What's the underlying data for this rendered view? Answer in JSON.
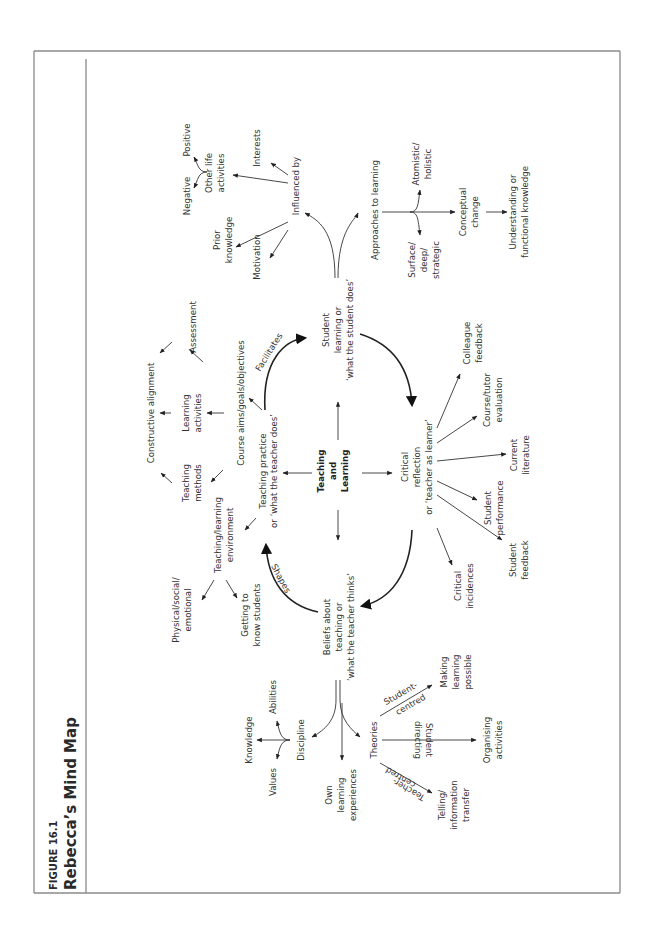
{
  "figure": {
    "number_label": "FIGURE 16.1",
    "title": "Rebecca’s Mind Map",
    "orientation": "rotated-90-ccw"
  },
  "center": {
    "line1": "Teaching",
    "line2": "and",
    "line3": "Learning"
  },
  "nodes": {
    "teaching_practice": [
      "Teaching practice",
      "or ‘what the teacher does’"
    ],
    "student_learning": [
      "Student",
      "learning or",
      "‘what the student does’"
    ],
    "critical_reflection": [
      "Critical",
      "reflection",
      "or ‘teacher as learner’"
    ],
    "beliefs": [
      "Beliefs about",
      "teaching or",
      "‘what the teacher thinks’"
    ],
    "course_aims": [
      "Course aims/goals/objectives"
    ],
    "teaching_methods": [
      "Teaching",
      "methods"
    ],
    "learning_activities": [
      "Learning",
      "activities"
    ],
    "assessment": [
      "Assessment"
    ],
    "constructive_alignment": [
      "Constructive alignment"
    ],
    "tl_environment": [
      "Teaching/learning",
      "environment"
    ],
    "physical_social": [
      "Physical/social/",
      "emotional"
    ],
    "getting_to_know": [
      "Getting to",
      "know students"
    ],
    "influenced_by": [
      "Influenced by"
    ],
    "prior_knowledge": [
      "Prior",
      "knowledge"
    ],
    "motivation": [
      "Motivation"
    ],
    "other_life": [
      "Other life",
      "activities"
    ],
    "interests": [
      "Interests"
    ],
    "negative": [
      "Negative"
    ],
    "positive": [
      "Positive"
    ],
    "approaches": [
      "Approaches to learning"
    ],
    "surface": [
      "Surface/",
      "deep/",
      "strategic"
    ],
    "atomistic": [
      "Atomistic/",
      "holistic"
    ],
    "conceptual_change": [
      "Conceptual",
      "change"
    ],
    "understanding": [
      "Understanding or",
      "functional knowledge"
    ],
    "critical_incidences": [
      "Critical",
      "incidences"
    ],
    "student_feedback": [
      "Student",
      "feedback"
    ],
    "student_performance": [
      "Student",
      "performance"
    ],
    "current_literature": [
      "Current",
      "literature"
    ],
    "course_tutor_eval": [
      "Course/tutor",
      "evaluation"
    ],
    "colleague_feedback": [
      "Colleague",
      "feedback"
    ],
    "discipline": [
      "Discipline"
    ],
    "knowledge": [
      "Knowledge"
    ],
    "values": [
      "Values"
    ],
    "abilities": [
      "Abilities"
    ],
    "own_learning": [
      "Own",
      "learning",
      "experiences"
    ],
    "theories": [
      "Theories"
    ],
    "making_learning": [
      "Making",
      "learning",
      "possible"
    ],
    "organising": [
      "Organising",
      "activities"
    ],
    "telling": [
      "Telling/",
      "information",
      "transfer"
    ]
  },
  "edge_labels": {
    "facilitates": "Facilitates",
    "shapes": "Shapes",
    "student_centred": [
      "Student-",
      "centred"
    ],
    "student_directing": [
      "Student",
      "directing"
    ],
    "teacher_centred": [
      "Teacher-",
      "centred"
    ]
  },
  "colors": {
    "text": "#333333",
    "lines": "#333333",
    "frame": "#8a8a8a",
    "background": "#ffffff"
  }
}
